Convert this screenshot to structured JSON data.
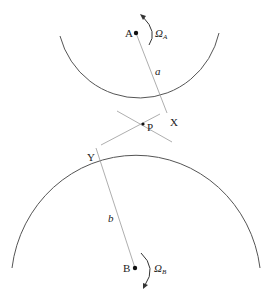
{
  "diagram": {
    "type": "two rolling circles with contact points",
    "labels": {
      "center_a": "A",
      "center_b": "B",
      "omega_a": "Ω",
      "omega_a_sub": "A",
      "omega_b": "Ω",
      "omega_b_sub": "B",
      "radius_a": "a",
      "radius_b": "b",
      "point_x": "X",
      "point_y": "Y",
      "point_p": "P"
    },
    "colors": {
      "stroke": "#555555",
      "thin_line": "#999999",
      "text": "#222222"
    }
  }
}
